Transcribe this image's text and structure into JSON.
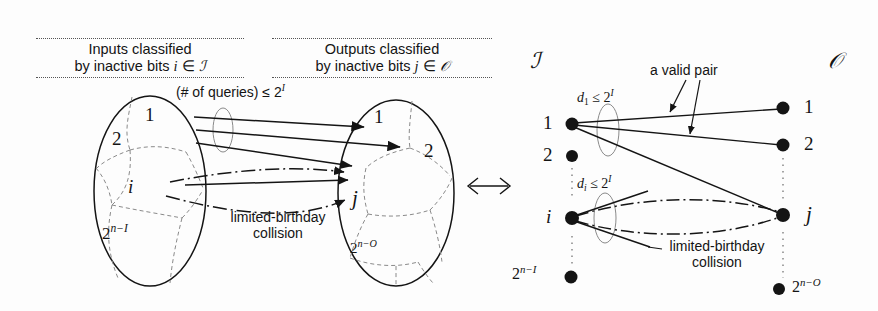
{
  "figure": {
    "equivalence_symbol": "⟺"
  },
  "left_diagram": {
    "input_caption": {
      "line1": "Inputs classified",
      "line2_prefix": "by inactive bits ",
      "line2_var": "i",
      "line2_member": " ∈ ",
      "line2_set": "ℐ"
    },
    "output_caption": {
      "line1": "Outputs classified",
      "line2_prefix": "by inactive bits ",
      "line2_var": "j",
      "line2_member": " ∈ ",
      "line2_set": "𝒪"
    },
    "queries_label": {
      "text": "(# of queries) ≤ 2",
      "exponent": "I"
    },
    "input_cells": [
      {
        "label": "1"
      },
      {
        "label": "2"
      },
      {
        "label": "i"
      },
      {
        "label": "2",
        "sup": "n−I"
      }
    ],
    "output_cells": [
      {
        "label": "1"
      },
      {
        "label": "2"
      },
      {
        "label": "j"
      },
      {
        "label": "2",
        "sup": "n−O"
      }
    ],
    "collision_label": {
      "line1": "limited-birthday",
      "line2": "collision"
    }
  },
  "right_diagram": {
    "left_set_symbol": "ℐ",
    "right_set_symbol": "𝒪",
    "valid_pair_label": "a valid pair",
    "degree_label_top": {
      "prefix": "d",
      "sub": "1",
      "rel": " ≤ 2",
      "exponent": "I"
    },
    "degree_label_bottom": {
      "prefix": "d",
      "sub": "i",
      "rel": " ≤ 2",
      "exponent": "I"
    },
    "collision_label": {
      "line1": "limited-birthday",
      "line2": "collision"
    },
    "left_nodes": [
      {
        "label": "1",
        "sup": ""
      },
      {
        "label": "2",
        "sup": ""
      },
      {
        "label": "i",
        "sup": ""
      },
      {
        "label": "2",
        "sup": "n−I"
      }
    ],
    "right_nodes": [
      {
        "label": "1",
        "sup": ""
      },
      {
        "label": "2",
        "sup": ""
      },
      {
        "label": "j",
        "sup": ""
      },
      {
        "label": "2",
        "sup": "n−O"
      }
    ],
    "vertical_ellipsis": "⋮"
  },
  "colors": {
    "ink": "#141414",
    "dashed_ink": "#6b6b6b",
    "background": "#fdfdfd"
  }
}
